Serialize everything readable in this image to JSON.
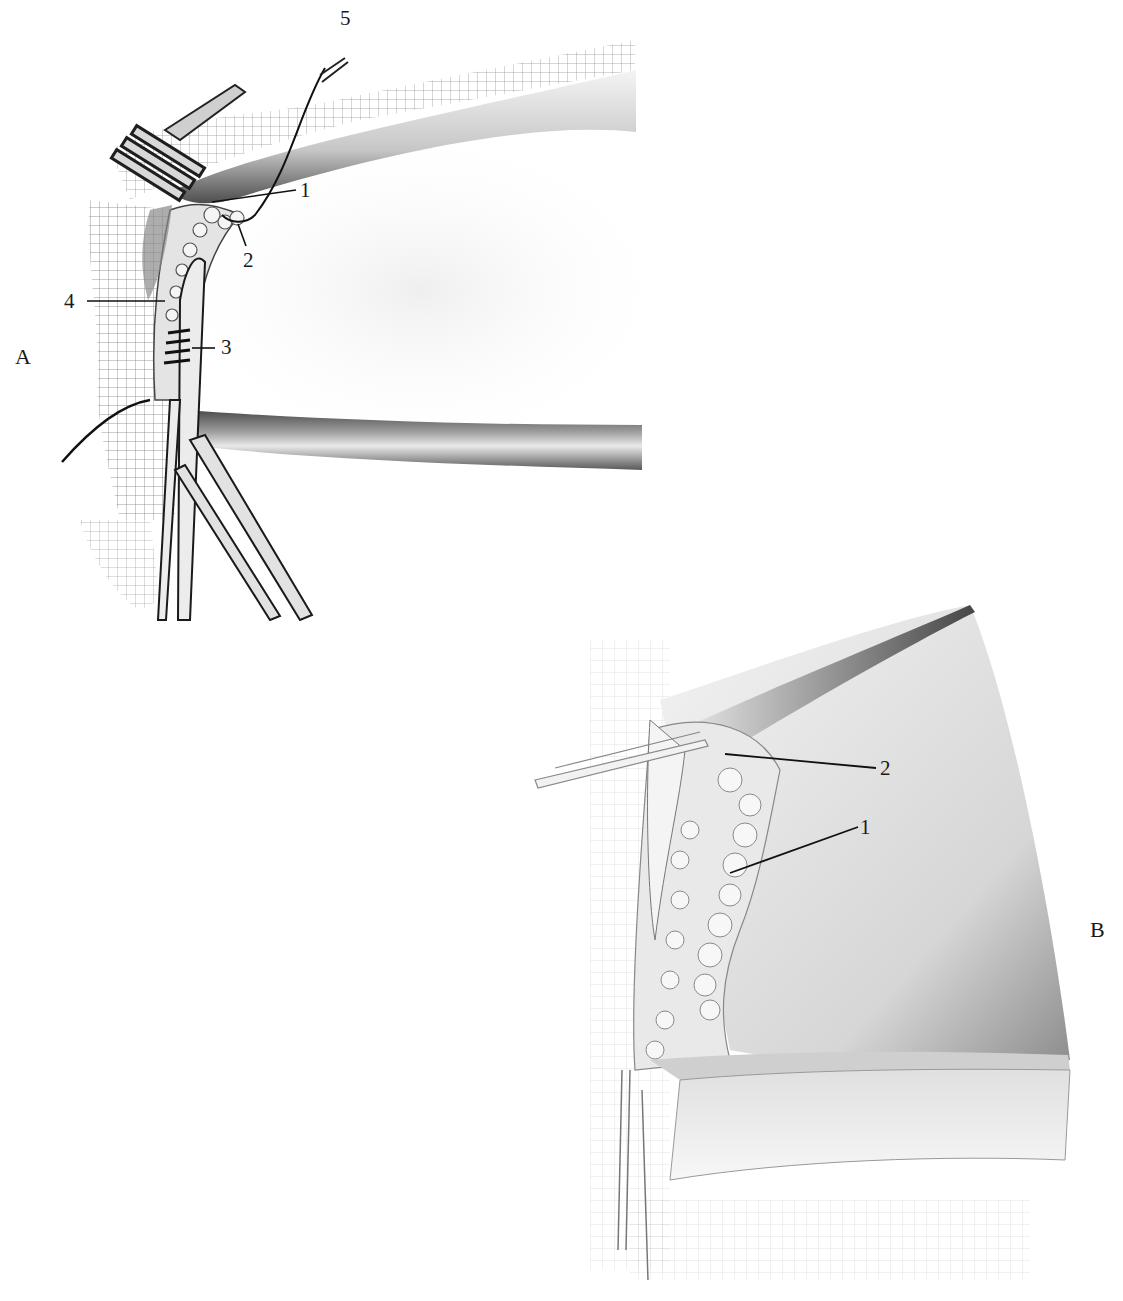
{
  "figure": {
    "panels": [
      {
        "id": "A",
        "letter": "A",
        "callouts": [
          {
            "number": "1"
          },
          {
            "number": "2"
          },
          {
            "number": "3"
          },
          {
            "number": "4"
          },
          {
            "number": "5"
          }
        ]
      },
      {
        "id": "B",
        "letter": "B",
        "callouts": [
          {
            "number": "2"
          },
          {
            "number": "1"
          }
        ]
      }
    ]
  },
  "colors": {
    "ink": "#1a1a1a",
    "shade": "#6b6b6b",
    "light_shade": "#cfcfcf",
    "paper": "#ffffff"
  }
}
